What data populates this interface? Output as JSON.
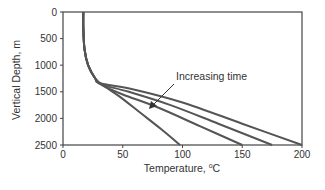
{
  "chart_data": {
    "type": "line",
    "title": "",
    "xlabel": "Temperature, °C",
    "xlabel_main": "Temperature, ",
    "xlabel_unit_sup": "o",
    "xlabel_unit": "C",
    "ylabel": "Vertical Depth, m",
    "xlim": [
      0,
      200
    ],
    "ylim": [
      2500,
      0
    ],
    "y_inverted": true,
    "x_ticks": [
      "0",
      "50",
      "100",
      "150",
      "200"
    ],
    "y_ticks": [
      "0",
      "500",
      "1000",
      "1500",
      "2000",
      "2500"
    ],
    "grid": false,
    "legend": null,
    "annotation": "Increasing time",
    "series": [
      {
        "name": "time 1",
        "points": [
          [
            17,
            0
          ],
          [
            17,
            300
          ],
          [
            18,
            700
          ],
          [
            21,
            1000
          ],
          [
            27,
            1250
          ],
          [
            35,
            1400
          ],
          [
            48,
            1600
          ],
          [
            65,
            1900
          ],
          [
            82,
            2200
          ],
          [
            98,
            2500
          ]
        ]
      },
      {
        "name": "time 2",
        "points": [
          [
            17,
            0
          ],
          [
            17,
            300
          ],
          [
            18,
            700
          ],
          [
            21,
            1000
          ],
          [
            27,
            1250
          ],
          [
            33,
            1380
          ],
          [
            50,
            1550
          ],
          [
            80,
            1800
          ],
          [
            115,
            2150
          ],
          [
            150,
            2500
          ]
        ]
      },
      {
        "name": "time 3",
        "points": [
          [
            17,
            0
          ],
          [
            17,
            300
          ],
          [
            18,
            700
          ],
          [
            21,
            1000
          ],
          [
            27,
            1250
          ],
          [
            32,
            1360
          ],
          [
            55,
            1500
          ],
          [
            90,
            1750
          ],
          [
            130,
            2100
          ],
          [
            175,
            2500
          ]
        ]
      },
      {
        "name": "time 4",
        "points": [
          [
            17,
            0
          ],
          [
            17,
            300
          ],
          [
            18,
            700
          ],
          [
            21,
            1000
          ],
          [
            27,
            1250
          ],
          [
            31,
            1340
          ],
          [
            60,
            1460
          ],
          [
            100,
            1700
          ],
          [
            150,
            2100
          ],
          [
            200,
            2500
          ]
        ]
      }
    ]
  },
  "colors": {
    "line": "#555555",
    "axis": "#444444",
    "text": "#333333"
  }
}
